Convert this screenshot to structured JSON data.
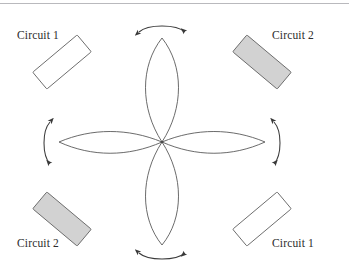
{
  "figure": {
    "background_color": "#ffffff",
    "top_rule_color": "#b9b9bd",
    "stroke_color": "#5a5a5a",
    "arrow_color": "#3a3a3a",
    "fill_gray": "#d2d2d2",
    "fill_white": "#ffffff",
    "center": {
      "x": 162,
      "y": 142
    }
  },
  "labels": [
    {
      "id": "top-left",
      "text": "Circuit 1",
      "corner": "top-left"
    },
    {
      "id": "top-right",
      "text": "Circuit 2",
      "corner": "top-right"
    },
    {
      "id": "bottom-left",
      "text": "Circuit 2",
      "corner": "bottom-left"
    },
    {
      "id": "bottom-right",
      "text": "Circuit 1",
      "corner": "bottom-right"
    }
  ],
  "coils": [
    {
      "id": "coil-top-left",
      "label": "Circuit 1",
      "fill": "white",
      "rotation_deg": -40,
      "cx": 62,
      "cy": 62,
      "w": 58,
      "h": 22
    },
    {
      "id": "coil-top-right",
      "label": "Circuit 2",
      "fill": "gray",
      "rotation_deg": 40,
      "cx": 262,
      "cy": 62,
      "w": 58,
      "h": 22
    },
    {
      "id": "coil-bottom-left",
      "label": "Circuit 2",
      "fill": "gray",
      "rotation_deg": 40,
      "cx": 62,
      "cy": 219,
      "w": 58,
      "h": 22
    },
    {
      "id": "coil-bottom-right",
      "label": "Circuit 1",
      "fill": "white",
      "rotation_deg": -40,
      "cx": 262,
      "cy": 219,
      "w": 58,
      "h": 22
    }
  ],
  "lobes": [
    {
      "id": "lobe-up",
      "direction": "up",
      "tip_x": 162,
      "tip_y": 38,
      "width": 30
    },
    {
      "id": "lobe-down",
      "direction": "down",
      "tip_x": 162,
      "tip_y": 245,
      "width": 30
    },
    {
      "id": "lobe-left",
      "direction": "left",
      "tip_x": 59,
      "tip_y": 142,
      "width": 30
    },
    {
      "id": "lobe-right",
      "direction": "right",
      "tip_x": 265,
      "tip_y": 142,
      "width": 30
    }
  ],
  "arrows": [
    {
      "id": "arrow-top",
      "position": "top",
      "type": "double-headed-arc"
    },
    {
      "id": "arrow-bottom",
      "position": "bottom",
      "type": "double-headed-arc"
    },
    {
      "id": "arrow-left",
      "position": "left",
      "type": "double-headed-arc"
    },
    {
      "id": "arrow-right",
      "position": "right",
      "type": "double-headed-arc"
    }
  ]
}
